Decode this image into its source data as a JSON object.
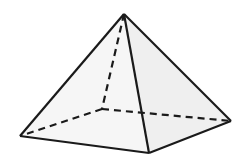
{
  "diagram": {
    "colors": {
      "stroke": "#1a1a1a",
      "face_fill": "#f3f3f3",
      "background": "#ffffff"
    },
    "vertices": {
      "apex": [
        124,
        14
      ],
      "base_back": [
        102,
        109
      ],
      "base_left": [
        20,
        136
      ],
      "base_front": [
        149,
        153
      ],
      "base_right": [
        231,
        121
      ]
    },
    "edges_solid": [
      [
        "apex",
        "base_left"
      ],
      [
        "apex",
        "base_front"
      ],
      [
        "apex",
        "base_right"
      ],
      [
        "base_left",
        "base_front"
      ],
      [
        "base_front",
        "base_right"
      ]
    ],
    "edges_hidden": [
      [
        "apex",
        "base_back"
      ],
      [
        "base_back",
        "base_left"
      ],
      [
        "base_back",
        "base_right"
      ]
    ]
  }
}
